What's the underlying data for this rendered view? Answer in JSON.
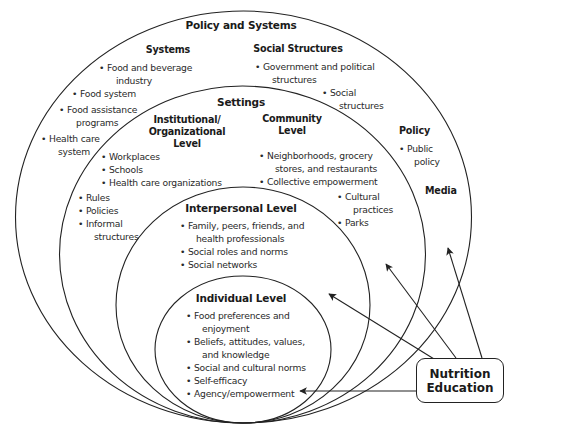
{
  "title": "Policy and Systems",
  "levels": {
    "policy_systems": {
      "heading": "Policy and Systems",
      "systems": {
        "heading": "Systems",
        "items": [
          "Food and beverage",
          "industry",
          "Food system",
          "Food assistance",
          "programs",
          "Health care",
          "system"
        ]
      },
      "social_structures": {
        "heading": "Social Structures",
        "items": [
          "Government and political",
          "structures",
          "Social",
          "structures"
        ]
      },
      "policy": {
        "heading": "Policy",
        "items": [
          "Public",
          "policy"
        ]
      },
      "media": {
        "heading": "Media"
      }
    },
    "settings": {
      "heading": "Settings",
      "institutional": {
        "heading_line1": "Institutional/",
        "heading_line2": "Organizational",
        "heading_line3": "Level",
        "items": [
          "Workplaces",
          "Schools",
          "Health care organizations"
        ],
        "items2": [
          "Rules",
          "Policies",
          "Informal",
          "structures"
        ]
      },
      "community": {
        "heading_line1": "Community",
        "heading_line2": "Level",
        "items": [
          "Neighborhoods, grocery",
          "stores, and restaurants",
          "Collective empowerment",
          "Cultural",
          "practices",
          "Parks"
        ]
      }
    },
    "interpersonal": {
      "heading": "Interpersonal Level",
      "items": [
        "Family, peers, friends, and",
        "health professionals",
        "Social roles and norms",
        "Social networks"
      ]
    },
    "individual": {
      "heading": "Individual Level",
      "items": [
        "Food preferences and",
        "enjoyment",
        "Beliefs, attitudes, values,",
        "and knowledge",
        "Social and cultural norms",
        "Self-efficacy",
        "Agency/empowerment"
      ]
    }
  },
  "nutrition_education": {
    "line1": "Nutrition",
    "line2": "Education"
  },
  "colors": {
    "stroke": "#222222",
    "text": "#2a2a2a",
    "background": "#ffffff"
  }
}
